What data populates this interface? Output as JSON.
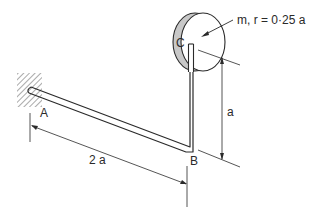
{
  "diagram": {
    "type": "mechanics-figure",
    "labels": {
      "point_a": "A",
      "point_b": "B",
      "point_c": "C",
      "disk_spec": "m, r = 0·25 a",
      "dim_horizontal": "2 a",
      "dim_vertical": "a"
    },
    "colors": {
      "ink": "#2a2a2a",
      "background": "#ffffff",
      "disk_rim": "#c8c8c8"
    }
  }
}
